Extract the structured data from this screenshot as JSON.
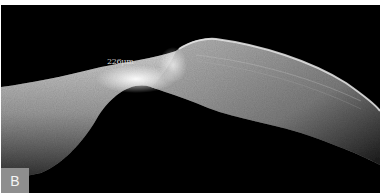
{
  "image": {
    "type": "OCT cross-section scan",
    "background_color": "#000000",
    "tissue_color": "#c8c8c8",
    "highlight_color": "#f2f2f2"
  },
  "annotations": {
    "measurement_label": "226μm"
  },
  "panel": {
    "label": "B",
    "badge_color": "#8e8e8e"
  }
}
